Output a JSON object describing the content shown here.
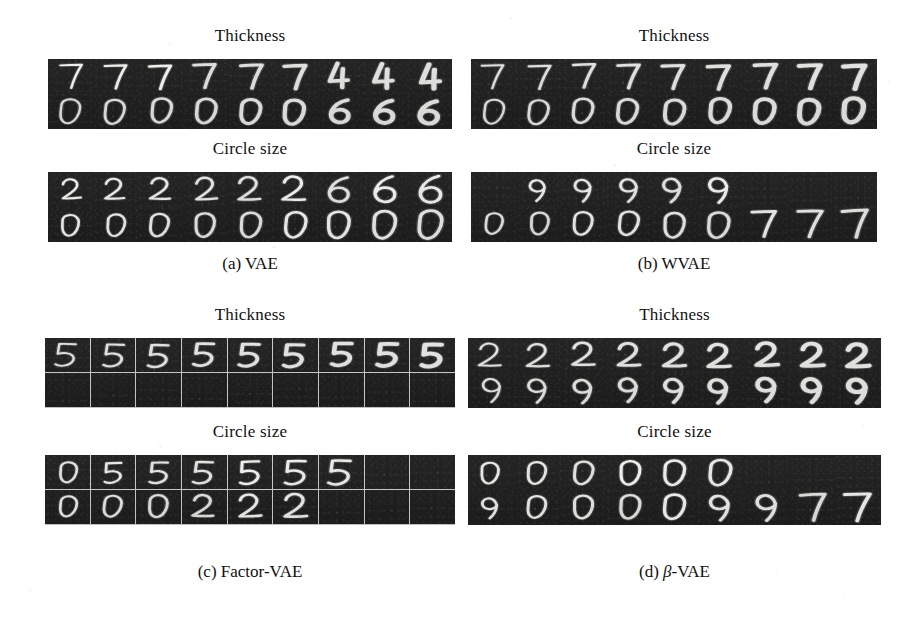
{
  "figure": {
    "caption_font": "serif",
    "background_color": "#ffffff",
    "strip_background_color": "#1d1d1d",
    "stroke_color": "#f2f2f2"
  },
  "panels": [
    {
      "id": "a",
      "caption": "(a) VAE",
      "gridlines": false,
      "strips": [
        {
          "label": "Thickness",
          "rows": [
            {
              "digits": [
                "7",
                "7",
                "7",
                "7",
                "7",
                "7",
                "4",
                "4",
                "4"
              ]
            },
            {
              "digits": [
                "0",
                "0",
                "0",
                "0",
                "0",
                "0",
                "6",
                "6",
                "6"
              ]
            }
          ]
        },
        {
          "label": "Circle size",
          "rows": [
            {
              "digits": [
                "2",
                "2",
                "2",
                "2",
                "2",
                "2",
                "6",
                "6",
                "6"
              ]
            },
            {
              "digits": [
                "0",
                "0",
                "0",
                "0",
                "0",
                "0",
                "0",
                "0",
                "0"
              ]
            }
          ]
        }
      ]
    },
    {
      "id": "b",
      "caption": "(b) WVAE",
      "gridlines": false,
      "strips": [
        {
          "label": "Thickness",
          "rows": [
            {
              "digits": [
                "7",
                "7",
                "7",
                "7",
                "7",
                "7",
                "7",
                "7",
                "7"
              ]
            },
            {
              "digits": [
                "0",
                "0",
                "0",
                "0",
                "0",
                "0",
                "0",
                "0",
                "0"
              ]
            }
          ]
        },
        {
          "label": "Circle size",
          "rows": [
            {
              "digits": [
                "1",
                "9",
                "9",
                "9",
                "9",
                "9",
                "1",
                "1",
                "1"
              ]
            },
            {
              "digits": [
                "0",
                "0",
                "0",
                "0",
                "0",
                "0",
                "7",
                "7",
                "7"
              ]
            }
          ]
        }
      ]
    },
    {
      "id": "c",
      "caption": "(c) Factor-VAE",
      "gridlines": true,
      "strips": [
        {
          "label": "Thickness",
          "rows": [
            {
              "digits": [
                "5",
                "5",
                "5",
                "5",
                "5",
                "5",
                "5",
                "5",
                "5"
              ]
            },
            {
              "digits": [
                "1",
                "1",
                "1",
                "1",
                "1",
                "1",
                "1",
                "1",
                "1"
              ]
            }
          ]
        },
        {
          "label": "Circle size",
          "rows": [
            {
              "digits": [
                "0",
                "5",
                "5",
                "5",
                "5",
                "5",
                "5",
                "1",
                "1"
              ]
            },
            {
              "digits": [
                "0",
                "0",
                "0",
                "2",
                "2",
                "2",
                "1",
                "1",
                "1"
              ]
            }
          ]
        }
      ]
    },
    {
      "id": "d",
      "caption": "(d) β-VAE",
      "caption_parts": {
        "prefix": "(d) ",
        "beta": "β",
        "suffix": "-VAE"
      },
      "gridlines": false,
      "strips": [
        {
          "label": "Thickness",
          "rows": [
            {
              "digits": [
                "2",
                "2",
                "2",
                "2",
                "2",
                "2",
                "2",
                "2",
                "2"
              ]
            },
            {
              "digits": [
                "9",
                "9",
                "9",
                "9",
                "9",
                "9",
                "9",
                "9",
                "9"
              ]
            }
          ]
        },
        {
          "label": "Circle size",
          "rows": [
            {
              "digits": [
                "0",
                "0",
                "0",
                "0",
                "0",
                "0",
                "1",
                "1",
                "1"
              ]
            },
            {
              "digits": [
                "9",
                "0",
                "0",
                "0",
                "0",
                "9",
                "9",
                "7",
                "7"
              ]
            }
          ]
        }
      ]
    }
  ]
}
